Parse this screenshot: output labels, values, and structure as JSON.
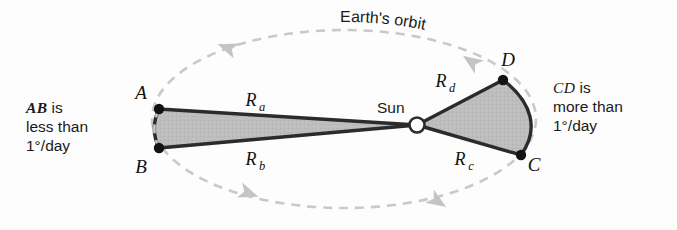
{
  "figure": {
    "background_color": "#fdfdfd"
  },
  "colors": {
    "orbit_dashed": "#c9c9c9",
    "arrow_fill": "#c4c4c4",
    "wedge_fill": "#bdbdbd",
    "wedge_stroke": "#2b2b2b",
    "point_fill": "#121212",
    "sun_fill": "#ffffff",
    "sun_stroke": "#2b2b2b",
    "text": "#1a1a1a"
  },
  "orbit": {
    "label": "Earth's orbit",
    "center_x": 344,
    "center_y": 119,
    "radius_x": 192,
    "radius_y": 89,
    "dash": "9 7",
    "stroke_width": 2.6
  },
  "sun": {
    "label": "Sun",
    "x": 417,
    "y": 125,
    "radius": 7.5,
    "label_x": 377,
    "label_y": 113
  },
  "points": [
    {
      "id": "A",
      "label": "A",
      "x": 159,
      "y": 109,
      "label_x": 141,
      "label_y": 99,
      "dot_r": 5.2
    },
    {
      "id": "B",
      "label": "B",
      "x": 159,
      "y": 148,
      "label_x": 141,
      "label_y": 173,
      "dot_r": 5.2
    },
    {
      "id": "C",
      "label": "C",
      "x": 521,
      "y": 155,
      "label_x": 530,
      "label_y": 171,
      "dot_r": 5.2
    },
    {
      "id": "D",
      "label": "D",
      "x": 503,
      "y": 80,
      "label_x": 496,
      "label_y": 66,
      "dot_r": 5.2
    }
  ],
  "radii": [
    {
      "id": "Ra",
      "base": "R",
      "sub": "a",
      "label_x": 251,
      "label_y": 106
    },
    {
      "id": "Rb",
      "base": "R",
      "sub": "b",
      "label_x": 251,
      "label_y": 165
    },
    {
      "id": "Rc",
      "base": "R",
      "sub": "c",
      "label_x": 460,
      "label_y": 165
    },
    {
      "id": "Rd",
      "base": "R",
      "sub": "d",
      "label_x": 441,
      "label_y": 87
    }
  ],
  "wedges": [
    {
      "id": "AB-wedge",
      "name": "slow-sector-AB",
      "from_point": "A",
      "to_point": "B",
      "description": "narrow sector swept near aphelion"
    },
    {
      "id": "CD-wedge",
      "name": "fast-sector-CD",
      "from_point": "D",
      "to_point": "C",
      "description": "wide sector swept near perihelion"
    }
  ],
  "direction_arrows": [
    {
      "id": "arrow-top-left",
      "x": 228,
      "y": 48,
      "rotation": 200
    },
    {
      "id": "arrow-top-right",
      "x": 472,
      "y": 62,
      "rotation": 215
    },
    {
      "id": "arrow-bottom-left",
      "x": 248,
      "y": 193,
      "rotation": 20
    },
    {
      "id": "arrow-bottom-right",
      "x": 437,
      "y": 201,
      "rotation": 33
    }
  ],
  "callouts": {
    "left": {
      "term": "AB",
      "term_suffix": " is",
      "line2": "less than",
      "line3": "1°/day"
    },
    "right": {
      "term": "CD",
      "term_suffix": " is",
      "line2": "more than",
      "line3": "1°/day"
    }
  }
}
